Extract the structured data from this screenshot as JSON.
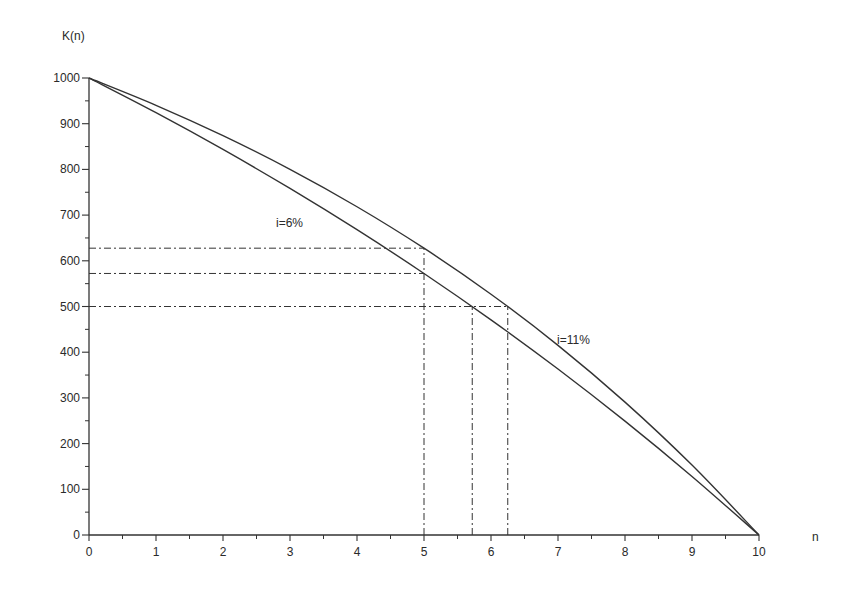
{
  "chart_data": {
    "type": "line",
    "title": "",
    "xlabel": "n",
    "ylabel": "K(n)",
    "xlim": [
      0,
      10
    ],
    "ylim": [
      0,
      1000
    ],
    "grid": false,
    "legend": "none (inline annotations)",
    "x_ticks": [
      0,
      1,
      2,
      3,
      4,
      5,
      6,
      7,
      8,
      9,
      10
    ],
    "x_minor_ticks_step": 0.5,
    "y_ticks": [
      0,
      100,
      200,
      300,
      400,
      500,
      600,
      700,
      800,
      900,
      1000
    ],
    "y_minor_ticks_step": 50,
    "x": [
      0,
      1,
      2,
      3,
      4,
      5,
      6,
      7,
      8,
      9,
      10
    ],
    "series": [
      {
        "name": "i=6%",
        "values": [
          1000,
          924.1,
          843.7,
          758.4,
          668.1,
          572.3,
          470.8,
          363.2,
          249.1,
          128.2,
          0
        ]
      },
      {
        "name": "i=11%",
        "values": [
          1000,
          940.2,
          873.8,
          800.1,
          718.3,
          627.6,
          526.8,
          415.0,
          290.8,
          153.0,
          0
        ]
      }
    ],
    "reference_lines": [
      {
        "type": "horizontal",
        "y": 627.6,
        "x_from": 0,
        "x_to": 5,
        "style": "dash-dot"
      },
      {
        "type": "horizontal",
        "y": 572.3,
        "x_from": 0,
        "x_to": 5,
        "style": "dash-dot"
      },
      {
        "type": "horizontal",
        "y": 500,
        "x_from": 0,
        "x_to": 6.25,
        "style": "dash-dot"
      },
      {
        "type": "vertical",
        "x": 5,
        "y_from": 0,
        "y_to": 627.6,
        "style": "dash-dot"
      },
      {
        "type": "vertical",
        "x": 5.72,
        "y_from": 0,
        "y_to": 500,
        "style": "dash-dot"
      },
      {
        "type": "vertical",
        "x": 6.25,
        "y_from": 0,
        "y_to": 500,
        "style": "dash-dot"
      }
    ],
    "annotations": [
      {
        "text": "i=6%",
        "x": 2.95,
        "y": 680
      },
      {
        "text": "i=11%",
        "x": 7.0,
        "y": 425
      }
    ]
  },
  "labels": {
    "y_axis_title": "K(n)",
    "x_axis_title": "n",
    "annot_6": "i=6%",
    "annot_11": "i=11%"
  },
  "colors": {
    "line": "#333333",
    "text": "#2a2a2a",
    "background": "#ffffff"
  }
}
